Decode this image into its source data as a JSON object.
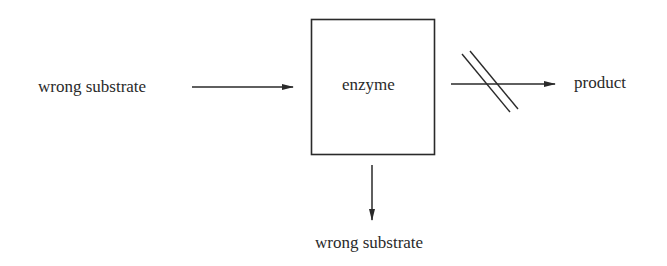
{
  "diagram": {
    "type": "flow",
    "nodes": {
      "input": {
        "label": "wrong substrate"
      },
      "enzyme": {
        "label": "enzyme"
      },
      "product": {
        "label": "product"
      },
      "output": {
        "label": "wrong substrate"
      }
    },
    "edges": [
      {
        "from": "input",
        "to": "enzyme",
        "blocked": false
      },
      {
        "from": "enzyme",
        "to": "product",
        "blocked": true
      },
      {
        "from": "enzyme",
        "to": "output",
        "blocked": false
      }
    ],
    "colors": {
      "stroke": "#2a2a2a",
      "background": "#ffffff"
    }
  }
}
